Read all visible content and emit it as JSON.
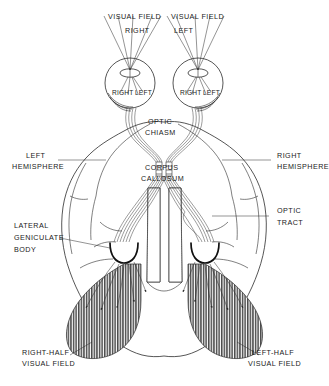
{
  "figure": {
    "kind": "anatomical-diagram",
    "background_color": "#ffffff",
    "ink_color": "#2b2b2b",
    "shade_color": "#4a4a4a"
  },
  "labels": {
    "visual_field_right": {
      "line1": "VISUAL FIELD",
      "line2": "RIGHT"
    },
    "visual_field_left": {
      "line1": "VISUAL FIELD",
      "line2": "LEFT"
    },
    "eye_left_inner": {
      "right": "RIGHT",
      "left": "LEFT"
    },
    "eye_right_inner": {
      "right": "RIGHT",
      "left": "LEFT"
    },
    "optic_chiasm": {
      "line1": "OPTIC",
      "line2": "CHIASM"
    },
    "corpus_callosum": {
      "line1": "CORPUS",
      "line2": "CALLOSUM"
    },
    "left_hemisphere": {
      "line1": "LEFT",
      "line2": "HEMISPHERE"
    },
    "right_hemisphere": {
      "line1": "RIGHT",
      "line2": "HEMISPHERE"
    },
    "lateral_geniculate_body": {
      "line1": "LATERAL",
      "line2": "GENICULATE",
      "line3": "BODY"
    },
    "optic_tract": {
      "line1": "OPTIC",
      "line2": "TRACT"
    },
    "right_half_visual_field": {
      "line1": "RIGHT-HALF",
      "line2": "VISUAL FIELD"
    },
    "left_half_visual_field": {
      "line1": "LEFT-HALF",
      "line2": "VISUAL FIELD"
    }
  },
  "icons": {
    "eye": "eye-icon",
    "arrow": "arrow-icon",
    "hatch": "hatch-pattern-icon"
  }
}
